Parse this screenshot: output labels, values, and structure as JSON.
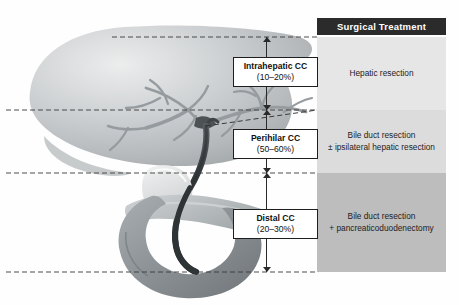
{
  "figure": {
    "background_color": "#ffffff"
  },
  "anatomy": {
    "structures": [
      {
        "name": "liver",
        "label": "Liver",
        "color": "#bfc2c4"
      },
      {
        "name": "intrahepatic-bile-ducts",
        "label": "Intrahepatic bile ducts",
        "color": "#9aa0a3"
      },
      {
        "name": "hepatic-duct-confluence",
        "label": "Hilum / confluence",
        "color": "#4a4f52"
      },
      {
        "name": "common-bile-duct",
        "label": "Common bile duct",
        "color": "#3c4144"
      },
      {
        "name": "gallbladder",
        "label": "Gallbladder",
        "color": "#d8dadb"
      },
      {
        "name": "pancreas",
        "label": "Pancreas",
        "color": "#aeb3b6"
      },
      {
        "name": "duodenum",
        "label": "Duodenum",
        "color": "#8e9497"
      }
    ]
  },
  "classification": {
    "boxes": [
      {
        "name": "intrahepatic",
        "title": "Intrahepatic CC",
        "percent": "(10–20%)"
      },
      {
        "name": "perihilar",
        "title": "Perihilar CC",
        "percent": "(50–60%)"
      },
      {
        "name": "distal",
        "title": "Distal CC",
        "percent": "(20–30%)"
      }
    ]
  },
  "treatment_panel": {
    "header": "Surgical Treatment",
    "header_bg": "#2b2b2b",
    "header_color": "#ffffff",
    "bands": [
      {
        "name": "hepatic-resection",
        "lines": [
          "Hepatic resection"
        ],
        "bg": "#e6e6e6"
      },
      {
        "name": "bile-duct-resection-ipsilateral",
        "lines": [
          "Bile duct resection",
          "± ipsilateral hepatic resection"
        ],
        "bg": "#dcdcdc"
      },
      {
        "name": "bile-duct-resection-whipple",
        "lines": [
          "Bile duct resection",
          "+ pancreaticoduodenectomy"
        ],
        "bg": "#bdbdbd"
      }
    ]
  },
  "guides": {
    "dashed_line_color": "#3a3a3a",
    "levels": [
      37,
      110,
      173,
      272
    ]
  },
  "footer": {
    "cut_off_caption": ""
  }
}
